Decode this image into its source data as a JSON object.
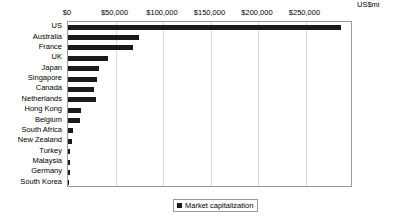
{
  "chart_data": {
    "type": "bar",
    "orientation": "horizontal",
    "title": "",
    "xlabel": "US$mi",
    "ylabel": "",
    "unit_label": "US$mi",
    "xlim": [
      0,
      300000
    ],
    "xticks": [
      0,
      50000,
      100000,
      150000,
      200000,
      250000
    ],
    "xtick_labels": [
      "$0",
      "$50,000",
      "$100,000",
      "$150,000",
      "$200,000",
      "$250,000"
    ],
    "grid": true,
    "legend_position": "bottom-center",
    "legend": [
      "Market capitalization"
    ],
    "series": [
      {
        "name": "Market capitalization",
        "color": "#1a1a1a",
        "values": [
          287000,
          75000,
          68000,
          42000,
          33000,
          30000,
          27000,
          29000,
          14000,
          13000,
          5000,
          4000,
          2500,
          2200,
          1800,
          1200
        ]
      }
    ],
    "categories": [
      "US",
      "Australia",
      "France",
      "UK",
      "Japan",
      "Singapore",
      "Canada",
      "Netherlands",
      "Hong Kong",
      "Belgium",
      "South Africa",
      "New Zealand",
      "Turkey",
      "Malaysia",
      "Germany",
      "South Korea"
    ]
  },
  "legend": {
    "items": [
      {
        "label": "Market capitalization",
        "color": "#1a1a1a"
      }
    ]
  }
}
